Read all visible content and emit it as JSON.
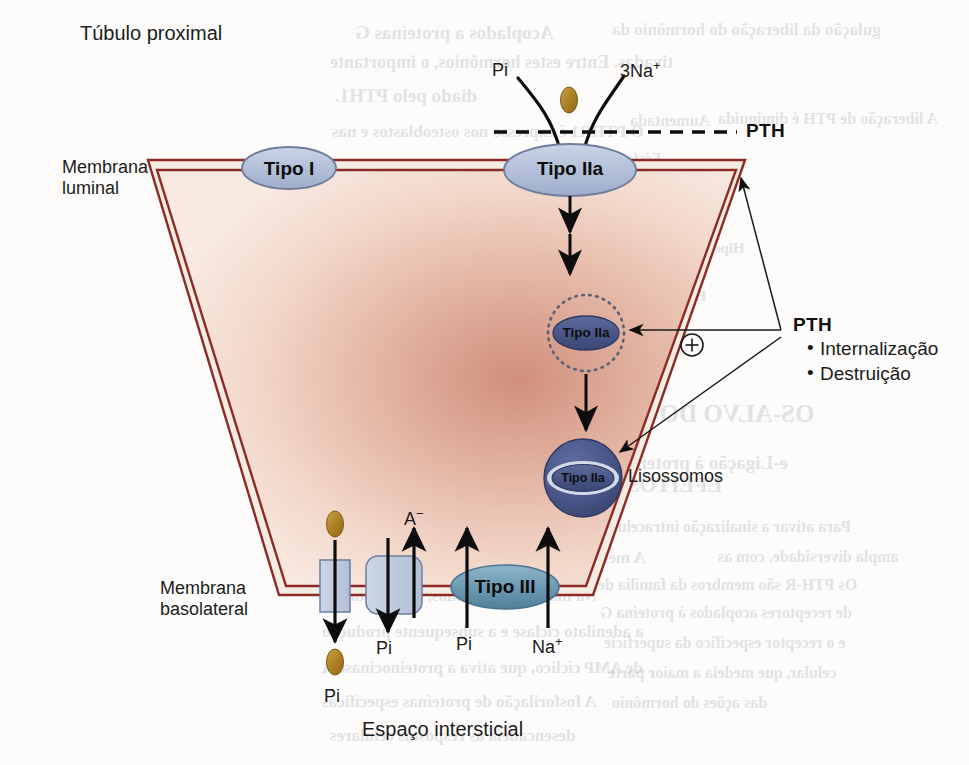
{
  "figure": {
    "title": "Túbulo proximal",
    "bottom_caption": "Espaço intersticial",
    "membrane_luminal": "Membrana\nluminal",
    "membrane_luminal_line1": "Membrana",
    "membrane_luminal_line2": "luminal",
    "membrane_basolateral_line1": "Membrana",
    "membrane_basolateral_line2": "basolateral"
  },
  "transporters": {
    "type_i": "Tipo I",
    "type_iia_luminal": "Tipo IIa",
    "type_iia_vesicle": "Tipo IIa",
    "type_iia_lysosome": "Tipo IIa",
    "type_iii": "Tipo III",
    "lysosome_label": "Lisossomos"
  },
  "luminal_solutes": {
    "phosphate": "Pi",
    "sodium": "3Na",
    "sodium_charge": "+"
  },
  "hormone": {
    "dashed_line_label": "PTH",
    "block_title": "PTH",
    "effects": [
      "Internalização",
      "Destruição"
    ],
    "plus_sign": "+"
  },
  "basolateral_solutes": {
    "pi_out_top": "Pi",
    "pi_out_bottom": "Pi",
    "pi_channel": "Pi",
    "anion": "A",
    "anion_charge": "−",
    "pi_in": "Pi",
    "na_in": "Na",
    "na_charge": "+"
  },
  "colors": {
    "cytoplasm_center": "#d79a86",
    "cytoplasm_edge": "#f6e2d8",
    "membrane_line": "#8e2a25",
    "membrane_fill": "#f2ece3",
    "oval_light_fill": "#b9c4da",
    "oval_light_stroke": "#707f9c",
    "oval_dark_fill": "#4e5b8e",
    "oval_dark_stroke": "#2f3a63",
    "type_iii_fill": "#6e9bb4",
    "lysosome_fill": "#47548c",
    "pi_particle": "#b08428",
    "channel_fill": "#c3cee1",
    "channel_stroke": "#6b7da0",
    "arrow": "#0d0d0d",
    "text": "#1b1b1b",
    "page_background": "#fdfcfa"
  },
  "bleed_through": [
    {
      "text": "Acoplados a proteínas G",
      "x": 355,
      "y": 22,
      "size": 19,
      "bold": true
    },
    {
      "text": "gulação da liberação do hormônio da",
      "x": 612,
      "y": 20,
      "size": 17,
      "bold": true
    },
    {
      "text": "tivadas. Entre estes hormônios, o importante",
      "x": 330,
      "y": 52,
      "size": 18,
      "bold": true
    },
    {
      "text": "diado pelo PTH1.",
      "x": 335,
      "y": 85,
      "size": 19,
      "bold": true
    },
    {
      "text": "Aumentada",
      "x": 630,
      "y": 112,
      "size": 16,
      "bold": true
    },
    {
      "text": "A liberação de PTH é diminuída",
      "x": 718,
      "y": 110,
      "size": 16,
      "bold": true
    },
    {
      "text": "O PTHR1 é expresso nos osteoblastos e nas",
      "x": 332,
      "y": 122,
      "size": 17,
      "bold": true
    },
    {
      "text": "Fósforo",
      "x": 612,
      "y": 150,
      "size": 15,
      "bold": true
    },
    {
      "text": "s renais. Quando o PTH se liga a este",
      "x": 340,
      "y": 157,
      "size": 17,
      "bold": true
    },
    {
      "text": "ocorrem alterações na conformação do",
      "x": 335,
      "y": 190,
      "size": 17,
      "bold": true
    },
    {
      "text": "Calcitriol",
      "x": 612,
      "y": 200,
      "size": 15,
      "bold": true
    },
    {
      "text": "m sinais que induzem a liberação de",
      "x": 345,
      "y": 224,
      "size": 17,
      "bold": true
    },
    {
      "text": "Hipercalcemia grave",
      "x": 612,
      "y": 240,
      "size": 15,
      "bold": true
    },
    {
      "text": "ctores de PTHR1 com bases suficientes",
      "x": 338,
      "y": 258,
      "size": 17,
      "bold": true
    },
    {
      "text": "estrutura plasmática semelhante do ciclo",
      "x": 335,
      "y": 290,
      "size": 17,
      "bold": true
    },
    {
      "text": "Hiperfosfatemia",
      "x": 602,
      "y": 288,
      "size": 15,
      "bold": true
    },
    {
      "text": "r estas respostas resultam pela importante",
      "x": 335,
      "y": 322,
      "size": 17,
      "bold": true
    },
    {
      "text": "e são formas do PTHR1 nos rins que",
      "x": 342,
      "y": 356,
      "size": 17,
      "bold": true
    },
    {
      "text": "o PTH, de modo a serem semelhantes",
      "x": 342,
      "y": 388,
      "size": 17,
      "bold": true
    },
    {
      "text": "OS-ALVO DO PTH",
      "x": 602,
      "y": 400,
      "size": 25,
      "bold": true
    },
    {
      "text": "receptores de PTH",
      "x": 350,
      "y": 418,
      "size": 17,
      "bold": true
    },
    {
      "text": "e-Ligação à proteína G",
      "x": 602,
      "y": 452,
      "size": 19,
      "bold": true
    },
    {
      "text": "EFEITOS CELULARES DO PTH",
      "x": 398,
      "y": 472,
      "size": 22,
      "bold": true
    },
    {
      "text": "Para ativar a sinalização intracelular",
      "x": 598,
      "y": 518,
      "size": 16,
      "bold": true
    },
    {
      "text": "A membrana celular. Estes efeitos devem-se",
      "x": 330,
      "y": 548,
      "size": 17,
      "bold": true
    },
    {
      "text": "ampla diversidade, com as",
      "x": 718,
      "y": 548,
      "size": 16,
      "bold": true
    },
    {
      "text": "Os PTH-R são membros da família de",
      "x": 598,
      "y": 576,
      "size": 16,
      "bold": true
    },
    {
      "text": "Na maioria dos tecidos, a resposta é a",
      "x": 326,
      "y": 586,
      "size": 17,
      "bold": true
    },
    {
      "text": "de receptores acoplados à proteína G",
      "x": 600,
      "y": 604,
      "size": 16,
      "bold": true
    },
    {
      "text": "a adenilato ciclase e a subsequente produção",
      "x": 322,
      "y": 622,
      "size": 17,
      "bold": true
    },
    {
      "text": "e o receptor específico da superfície",
      "x": 604,
      "y": 634,
      "size": 16,
      "bold": true
    },
    {
      "text": "de AMP cíclico, que ativa a proteinocinase A",
      "x": 322,
      "y": 658,
      "size": 17,
      "bold": true
    },
    {
      "text": "celular, que medeia a maior parte",
      "x": 608,
      "y": 664,
      "size": 16,
      "bold": true
    },
    {
      "text": "A fosforilação de proteínas específicas",
      "x": 322,
      "y": 692,
      "size": 17,
      "bold": true
    },
    {
      "text": "das ações do hormônio",
      "x": 612,
      "y": 694,
      "size": 16,
      "bold": true
    },
    {
      "text": "desencadeia as respostas celulares",
      "x": 330,
      "y": 726,
      "size": 17,
      "bold": true
    }
  ]
}
